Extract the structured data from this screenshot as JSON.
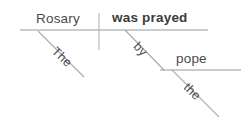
{
  "diagram": {
    "type": "reed-kellogg-sentence-diagram",
    "sentence": "The Rosary was prayed by the pope.",
    "labels": {
      "subject": "Rosary",
      "subject_article": "The",
      "verb": "was prayed",
      "preposition": "by",
      "object_article": "the",
      "object": "pope"
    },
    "colors": {
      "background": "#ffffff",
      "line": "#9a9a9a",
      "text": "#4a4a4a",
      "verb_text": "#3b3b3b"
    },
    "lines": {
      "baseline": {
        "x1": 20,
        "y1": 30,
        "x2": 208,
        "y2": 30
      },
      "subject_verb_divider": {
        "x1": 99,
        "y1": 13,
        "x2": 99,
        "y2": 50
      },
      "subject_modifier": {
        "x1": 38,
        "y1": 31,
        "x2": 84,
        "y2": 77
      },
      "preposition_slant": {
        "x1": 125,
        "y1": 30,
        "x2": 164,
        "y2": 70
      },
      "prep_object_baseline": {
        "x1": 160,
        "y1": 70,
        "x2": 241,
        "y2": 70
      },
      "object_modifier": {
        "x1": 172,
        "y1": 70,
        "x2": 219,
        "y2": 117
      }
    }
  }
}
